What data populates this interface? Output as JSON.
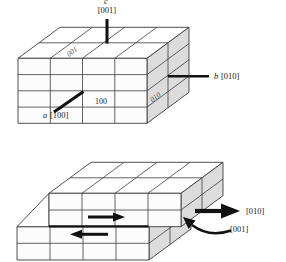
{
  "figure": {
    "background_color": "#ffffff",
    "line_color": "#3c3c3c",
    "shaded_face_color": "#dcdcdc",
    "accent_color": "#111111"
  },
  "top_diagram": {
    "description": "unit-cell block with crystallographic axes",
    "axis_c_letter": "c",
    "axis_c_label": "[001]",
    "axis_b_letter": "b",
    "axis_b_label": "[010]",
    "axis_a_letter": "a",
    "axis_a_label": "[100]",
    "plane_front_label": "100",
    "plane_top_label": "001",
    "plane_side_label": "010"
  },
  "bottom_diagram": {
    "description": "block sheared by slip, upper half displaced one lattice unit",
    "slip_direction_label": "[010]",
    "slip_plane_label": "[001]"
  }
}
